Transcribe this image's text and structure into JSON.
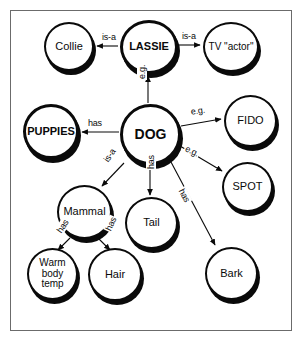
{
  "diagram": {
    "frame": {
      "border_color": "#6b6b6b"
    },
    "node_color": "#0a0a0a",
    "nodes": [
      {
        "id": "collie",
        "label": "Collie",
        "x": 44,
        "y": 22,
        "w": 50,
        "h": 49,
        "font": 11,
        "emph": false
      },
      {
        "id": "lassie",
        "label": "LASSIE",
        "x": 120,
        "y": 20,
        "w": 58,
        "h": 54,
        "font": 11,
        "emph": true
      },
      {
        "id": "tvactor",
        "label": "TV \"actor\"",
        "x": 203,
        "y": 22,
        "w": 56,
        "h": 50,
        "font": 10,
        "emph": false
      },
      {
        "id": "puppies",
        "label": "PUPPIES",
        "x": 23,
        "y": 104,
        "w": 56,
        "h": 55,
        "font": 11,
        "emph": true
      },
      {
        "id": "dog",
        "label": "DOG",
        "x": 120,
        "y": 104,
        "w": 61,
        "h": 61,
        "font": 14,
        "emph": true
      },
      {
        "id": "fido",
        "label": "FIDO",
        "x": 224,
        "y": 95,
        "w": 53,
        "h": 52,
        "font": 11,
        "emph": false
      },
      {
        "id": "spot",
        "label": "SPOT",
        "x": 222,
        "y": 162,
        "w": 51,
        "h": 50,
        "font": 11,
        "emph": false
      },
      {
        "id": "mammal",
        "label": "Mammal",
        "x": 57,
        "y": 185,
        "w": 55,
        "h": 54,
        "font": 11,
        "emph": false
      },
      {
        "id": "tail",
        "label": "Tail",
        "x": 125,
        "y": 197,
        "w": 53,
        "h": 52,
        "font": 11,
        "emph": false
      },
      {
        "id": "warm",
        "label": "Warm body temp",
        "x": 27,
        "y": 248,
        "w": 51,
        "h": 52,
        "font": 10,
        "emph": false
      },
      {
        "id": "hair",
        "label": "Hair",
        "x": 88,
        "y": 248,
        "w": 54,
        "h": 53,
        "font": 11,
        "emph": false
      },
      {
        "id": "bark",
        "label": "Bark",
        "x": 205,
        "y": 247,
        "w": 53,
        "h": 53,
        "font": 11,
        "emph": false
      }
    ],
    "edges": [
      {
        "id": "lassie-collie",
        "from": "lassie",
        "to": "collie",
        "label": "is-a",
        "x1": 118,
        "y1": 46,
        "x2": 97,
        "y2": 46,
        "lx": 101,
        "ly": 32,
        "rot": 0
      },
      {
        "id": "lassie-tvactor",
        "from": "lassie",
        "to": "tvactor",
        "label": "is-a",
        "x1": 179,
        "y1": 45,
        "x2": 200,
        "y2": 45,
        "lx": 181,
        "ly": 31,
        "rot": 0
      },
      {
        "id": "dog-lassie",
        "from": "dog",
        "to": "lassie",
        "label": "e.g.",
        "x1": 148,
        "y1": 103,
        "x2": 148,
        "y2": 76,
        "lx": 137,
        "ly": 80,
        "rot": -90
      },
      {
        "id": "dog-puppies",
        "from": "dog",
        "to": "puppies",
        "label": "has",
        "x1": 119,
        "y1": 132,
        "x2": 82,
        "y2": 132,
        "lx": 87,
        "ly": 118,
        "rot": 0
      },
      {
        "id": "dog-fido",
        "from": "dog",
        "to": "fido",
        "label": "e.g.",
        "x1": 181,
        "y1": 126,
        "x2": 221,
        "y2": 119,
        "lx": 189,
        "ly": 107,
        "rot": -9
      },
      {
        "id": "dog-spot",
        "from": "dog",
        "to": "spot",
        "label": "e.g.",
        "x1": 180,
        "y1": 146,
        "x2": 222,
        "y2": 171,
        "lx": 187,
        "ly": 143,
        "rot": 26
      },
      {
        "id": "dog-mammal",
        "from": "dog",
        "to": "mammal",
        "label": "is-a",
        "x1": 124,
        "y1": 163,
        "x2": 102,
        "y2": 186,
        "lx": 101,
        "ly": 159,
        "rot": -56
      },
      {
        "id": "dog-tail",
        "from": "dog",
        "to": "tail",
        "label": "has",
        "x1": 150,
        "y1": 166,
        "x2": 150,
        "y2": 195,
        "lx": 146,
        "ly": 170,
        "rot": -90
      },
      {
        "id": "dog-bark",
        "from": "dog",
        "to": "bark",
        "label": "has",
        "x1": 171,
        "y1": 162,
        "x2": 215,
        "y2": 245,
        "lx": 185,
        "ly": 186,
        "rot": 62
      },
      {
        "id": "mammal-warm",
        "from": "mammal",
        "to": "warm",
        "label": "has",
        "x1": 70,
        "y1": 238,
        "x2": 58,
        "y2": 250,
        "lx": 54,
        "ly": 230,
        "rot": -56
      },
      {
        "id": "mammal-hair",
        "from": "mammal",
        "to": "hair",
        "label": "has",
        "x1": 98,
        "y1": 238,
        "x2": 110,
        "y2": 250,
        "lx": 103,
        "ly": 229,
        "rot": -65
      }
    ],
    "relations_legend": {
      "is_a": "is-a",
      "has": "has",
      "example": "e.g."
    }
  }
}
